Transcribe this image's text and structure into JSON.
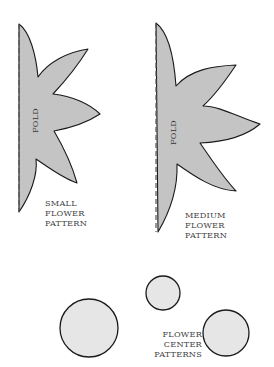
{
  "patterns": {
    "small_flower": {
      "fold_label": "FOLD",
      "label_lines": [
        "SMALL",
        "FLOWER",
        "PATTERN"
      ]
    },
    "medium_flower": {
      "fold_label": "FOLD",
      "label_lines": [
        "MEDIUM",
        "FLOWER",
        "PATTERN"
      ]
    },
    "flower_centers": {
      "label_lines": [
        "FLOWER",
        "CENTER",
        "PATTERNS"
      ],
      "count": 3
    }
  },
  "colors": {
    "petal_fill": "#c4c4c4",
    "circle_fill": "#e6e6e6",
    "outline": "#1a1a1a"
  }
}
